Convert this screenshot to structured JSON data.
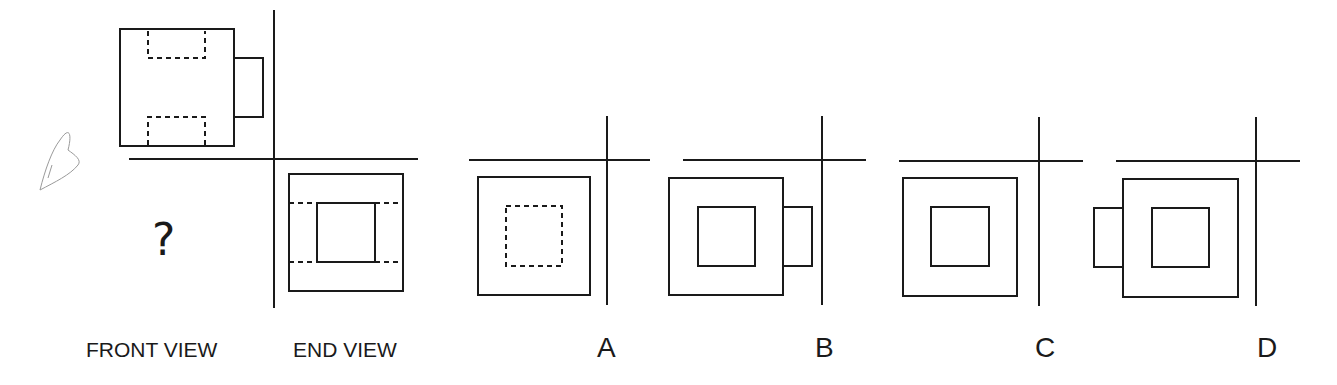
{
  "question": {
    "unknown_marker": "?",
    "annotation": "handwritten pencil mark near front view"
  },
  "views": {
    "front_label": "FRONT VIEW",
    "end_label": "END VIEW"
  },
  "options": [
    {
      "label": "A",
      "description": "square with dashed inner square"
    },
    {
      "label": "B",
      "description": "square with solid inner square and tab on right"
    },
    {
      "label": "C",
      "description": "square with solid inner square"
    },
    {
      "label": "D",
      "description": "square with solid inner square and tab on left"
    }
  ],
  "colors": {
    "line": "#1a1a1a",
    "background": "#ffffff",
    "pencil": "#9a9a9a"
  }
}
